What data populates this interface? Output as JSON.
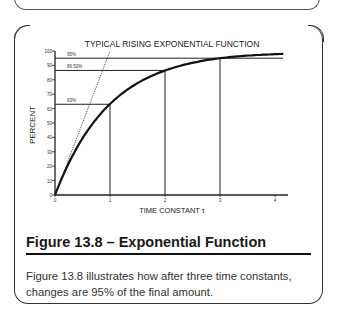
{
  "figure": {
    "caption_title": "Figure 13.8 – Exponential Function",
    "caption_text": "Figure 13.8 illustrates how after three time constants, changes are 95% of the final amount."
  },
  "chart_data": {
    "type": "line",
    "title": "TYPICAL RISING EXPONENTIAL FUNCTION",
    "xlabel": "TIME CONSTANT τ",
    "ylabel": "PERCENT",
    "xlim": [
      0,
      4
    ],
    "ylim": [
      0,
      100
    ],
    "x_ticks": [
      "0",
      "1",
      "2",
      "3",
      "4"
    ],
    "y_ticks": [
      "0",
      "10",
      "20",
      "30",
      "40",
      "50",
      "60",
      "70",
      "80",
      "90",
      "100"
    ],
    "grid": false,
    "series": [
      {
        "name": "rising exponential",
        "x": [
          0,
          0.5,
          1,
          1.5,
          2,
          2.5,
          3,
          3.5,
          4
        ],
        "values": [
          0,
          39,
          63,
          78,
          86.5,
          92,
          95,
          97,
          98
        ]
      },
      {
        "name": "initial slope (tangent)",
        "style": "dotted",
        "x": [
          0,
          1
        ],
        "values": [
          0,
          100
        ]
      }
    ],
    "annotations": [
      {
        "label": "63%",
        "x": 1,
        "y": 63
      },
      {
        "label": "86.50%",
        "x": 2,
        "y": 86.5
      },
      {
        "label": "95%",
        "x": 3,
        "y": 95
      }
    ]
  }
}
